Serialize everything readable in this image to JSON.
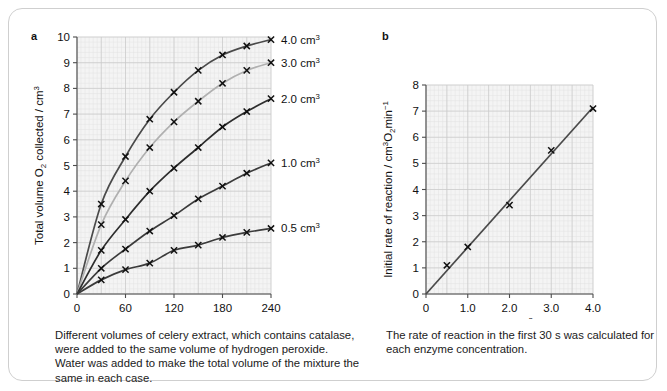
{
  "figure": {
    "panels": [
      {
        "letter": "a",
        "caption": "Different volumes of celery extract, which contains catalase, were added to the same volume of hydrogen peroxide. Water was added to make the total volume of the mixture the same in each case."
      },
      {
        "letter": "b",
        "caption": "The rate of reaction in the first 30 s was calculated for each enzyme concentration."
      }
    ]
  },
  "chart_data": [
    {
      "type": "line",
      "panel": "a",
      "title": "",
      "xlabel": "Time / s",
      "ylabel": "Total volume O2 collected / cm3",
      "ylabel_parts": {
        "pre": "Total volume O",
        "sub": "2",
        "mid": " collected / cm",
        "sup": "3"
      },
      "xlim": [
        0,
        240
      ],
      "ylim": [
        0,
        10
      ],
      "xticks": [
        0,
        60,
        120,
        180,
        240
      ],
      "xticklabels": [
        "0",
        "60",
        "120",
        "180",
        "240"
      ],
      "yticks": [
        0,
        1,
        2,
        3,
        4,
        5,
        6,
        7,
        8,
        9,
        10
      ],
      "yticklabels": [
        "0",
        "1",
        "2",
        "3",
        "4",
        "5",
        "6",
        "7",
        "8",
        "9",
        "10"
      ],
      "grid": true,
      "grid_minor": true,
      "legend_position": "right-of-curves",
      "x": [
        0,
        30,
        60,
        90,
        120,
        150,
        180,
        210,
        240
      ],
      "series": [
        {
          "name": "4.0 cm3",
          "label_pre": "4.0 cm",
          "label_sup": "3",
          "color": "#4a4a4a",
          "values": [
            0,
            3.5,
            5.35,
            6.8,
            7.85,
            8.7,
            9.3,
            9.65,
            9.9
          ]
        },
        {
          "name": "3.0 cm3",
          "label_pre": "3.0 cm",
          "label_sup": "3",
          "color": "#b0b0b0",
          "values": [
            0,
            2.7,
            4.4,
            5.7,
            6.7,
            7.5,
            8.2,
            8.7,
            9.0
          ]
        },
        {
          "name": "2.0 cm3",
          "label_pre": "2.0 cm",
          "label_sup": "3",
          "color": "#2d2d2d",
          "values": [
            0,
            1.7,
            2.9,
            4.0,
            4.9,
            5.7,
            6.5,
            7.1,
            7.6
          ]
        },
        {
          "name": "1.0 cm3",
          "label_pre": "1.0 cm",
          "label_sup": "3",
          "color": "#3b3b3b",
          "values": [
            0,
            1.0,
            1.75,
            2.45,
            3.05,
            3.7,
            4.2,
            4.7,
            5.1
          ]
        },
        {
          "name": "0.5 cm3",
          "label_pre": "0.5 cm",
          "label_sup": "3",
          "color": "#3b3b3b",
          "values": [
            0,
            0.55,
            0.95,
            1.2,
            1.7,
            1.9,
            2.2,
            2.4,
            2.55
          ]
        }
      ]
    },
    {
      "type": "scatter",
      "panel": "b",
      "title": "",
      "xlabel": "Enzyme concentration / cm3 of celery extract",
      "xlabel_parts": {
        "pre": "Enzyme concentration / cm",
        "sup": "3",
        "post": " of celery extract"
      },
      "ylabel": "Initial rate of reaction / cm3 O2 min-1",
      "ylabel_parts": {
        "pre": "Initial rate of reaction / cm",
        "sup": "3",
        "mid": "O",
        "sub": "2",
        "mid2": "min",
        "sup2": "−1"
      },
      "xlim": [
        0,
        4.0
      ],
      "ylim": [
        0,
        8
      ],
      "xticks": [
        0,
        1.0,
        2.0,
        3.0,
        4.0
      ],
      "xticklabels": [
        "0",
        "1.0",
        "2.0",
        "3.0",
        "4.0"
      ],
      "yticks": [
        0,
        1,
        2,
        3,
        4,
        5,
        6,
        7,
        8
      ],
      "yticklabels": [
        "0",
        "1",
        "2",
        "3",
        "4",
        "5",
        "6",
        "7",
        "8"
      ],
      "grid": true,
      "grid_minor": true,
      "points": [
        {
          "x": 0.5,
          "y": 1.1
        },
        {
          "x": 1.0,
          "y": 1.8
        },
        {
          "x": 2.0,
          "y": 3.4
        },
        {
          "x": 3.0,
          "y": 5.5
        },
        {
          "x": 4.0,
          "y": 7.1
        }
      ],
      "trendline": {
        "from": [
          0,
          0
        ],
        "to": [
          4.0,
          7.15
        ],
        "color": "#4a4a4a"
      }
    }
  ],
  "colors": {
    "axis": "#4d4d4d",
    "grid_major": "#c9c9c9",
    "grid_minor": "#e2e2e2",
    "plot_bg": "#f4f4f4",
    "text": "#1a1a1a",
    "card_border": "#cfcfcf"
  }
}
